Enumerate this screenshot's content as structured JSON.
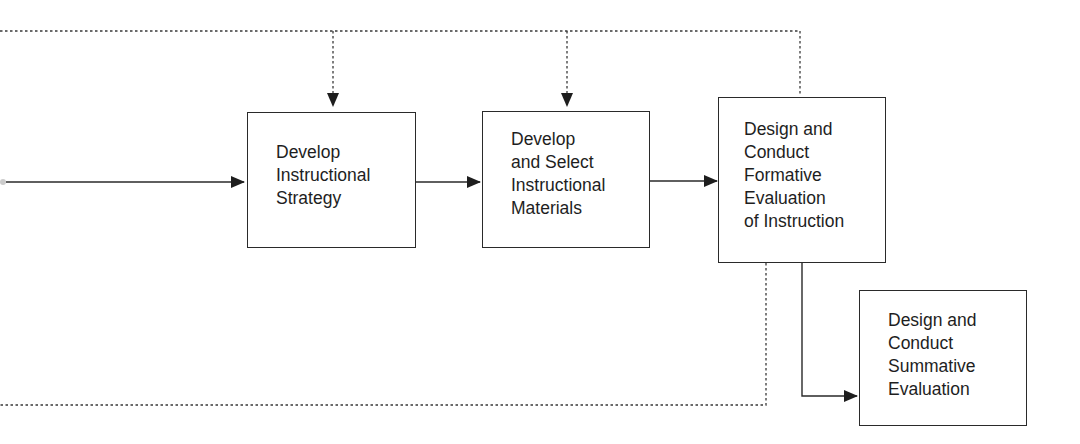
{
  "diagram": {
    "type": "flowchart",
    "boxes": [
      {
        "id": "strategy",
        "label": "Develop\nInstructional\nStrategy"
      },
      {
        "id": "materials",
        "label": "Develop\nand Select\nInstructional\nMaterials"
      },
      {
        "id": "formative",
        "label": "Design and\nConduct\nFormative\nEvaluation\nof Instruction"
      },
      {
        "id": "summative",
        "label": "Design and\nConduct\nSummative\nEvaluation"
      }
    ],
    "connections": [
      {
        "from": "left-offscreen",
        "to": "strategy",
        "style": "solid"
      },
      {
        "from": "strategy",
        "to": "materials",
        "style": "solid"
      },
      {
        "from": "materials",
        "to": "formative",
        "style": "solid"
      },
      {
        "from": "formative",
        "to": "summative",
        "style": "solid"
      },
      {
        "from": "formative",
        "to": "strategy",
        "style": "dotted",
        "note": "revision feedback loop via top line"
      },
      {
        "from": "formative",
        "to": "materials",
        "style": "dotted",
        "note": "revision feedback loop via top line"
      },
      {
        "from": "formative",
        "to": "left-offscreen",
        "style": "dotted",
        "note": "revision feedback loop via bottom line"
      }
    ],
    "colors": {
      "line": "#2a2a2a",
      "background": "#ffffff"
    }
  }
}
